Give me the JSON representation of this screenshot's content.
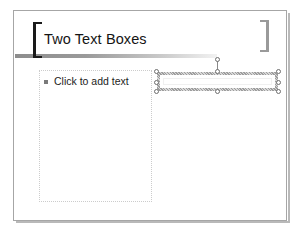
{
  "slide": {
    "background_color": "#ffffff",
    "border_color": "#a6a6a6",
    "title": {
      "text": "Two Text Boxes",
      "color": "#141414",
      "bracket_left_color": "#1a1a1a",
      "bracket_right_color": "#9a9a9a",
      "rule_color": "#8d8d8d"
    },
    "content_placeholder": {
      "prompt_text": "Click to add text",
      "bullet_glyph": "square-bullet",
      "border_style": "dotted",
      "border_color": "#cccccc"
    },
    "text_box": {
      "selected": true,
      "content": "",
      "handle_count": 8,
      "handle_fill": "#ffffff",
      "handle_stroke": "#6e6e6e",
      "rotation_handle": true,
      "frame_color": "#9d9d9d"
    }
  }
}
